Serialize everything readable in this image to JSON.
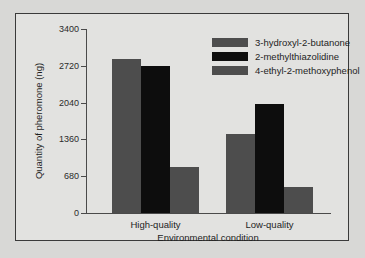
{
  "chart_data": {
    "type": "bar",
    "title": "",
    "xlabel": "Environmental condition",
    "ylabel": "Quantity of pheromone (ng)",
    "categories": [
      "High-quality",
      "Low-quality"
    ],
    "series": [
      {
        "name": "3-hydroxyl-2-butanone",
        "color": "#4d4d4d",
        "values": [
          2850,
          1460
        ]
      },
      {
        "name": "2-methylthiazolidine",
        "color": "#0d0d0d",
        "values": [
          2720,
          2010
        ]
      },
      {
        "name": "4-ethyl-2-methoxyphenol",
        "color": "#4d4d4d",
        "values": [
          850,
          480
        ]
      }
    ],
    "ylim": [
      0,
      3400
    ],
    "yticks": [
      0,
      680,
      1360,
      2040,
      2720,
      3400
    ],
    "ytick_labels": [
      "0",
      "680",
      "1360",
      "2040",
      "2720",
      "3400"
    ],
    "grid": false,
    "legend_position": "top-right"
  },
  "style": {
    "page_background": "#d8d8d6",
    "plot_background": "#e2e2e0",
    "frame_color": "#3a3a3a",
    "axis_color": "#4a4a4a",
    "text_color": "#1e1e1e"
  }
}
